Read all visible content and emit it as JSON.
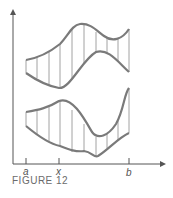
{
  "figure": {
    "caption": "FIGURE 12",
    "x_labels": {
      "a": "a",
      "x": "x",
      "b": "b"
    },
    "colors": {
      "curve": "#7a7a7a",
      "axis": "#555555",
      "hatch": "#8a8a8a"
    }
  }
}
